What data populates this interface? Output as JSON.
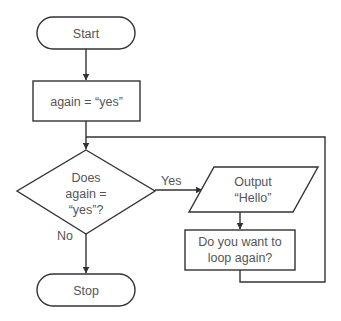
{
  "diagram": {
    "type": "flowchart",
    "colors": {
      "stroke": "#333333",
      "text": "#555555",
      "background": "#ffffff"
    },
    "nodes": [
      {
        "id": "start",
        "shape": "terminator",
        "lines": [
          "Start"
        ]
      },
      {
        "id": "init",
        "shape": "process",
        "lines": [
          "again = “yes”"
        ]
      },
      {
        "id": "decision",
        "shape": "decision",
        "lines": [
          "Does",
          "again =",
          "“yes”?"
        ]
      },
      {
        "id": "output",
        "shape": "input-output",
        "lines": [
          "Output",
          "“Hello”"
        ]
      },
      {
        "id": "ask",
        "shape": "process",
        "lines": [
          "Do you want to",
          "loop again?"
        ]
      },
      {
        "id": "stop",
        "shape": "terminator",
        "lines": [
          "Stop"
        ]
      }
    ],
    "edges": [
      {
        "from": "start",
        "to": "init",
        "label": ""
      },
      {
        "from": "init",
        "to": "decision",
        "label": ""
      },
      {
        "from": "decision",
        "to": "output",
        "label": "Yes"
      },
      {
        "from": "decision",
        "to": "stop",
        "label": "No"
      },
      {
        "from": "output",
        "to": "ask",
        "label": ""
      },
      {
        "from": "ask",
        "to": "decision",
        "label": "",
        "note": "loop back"
      }
    ]
  }
}
